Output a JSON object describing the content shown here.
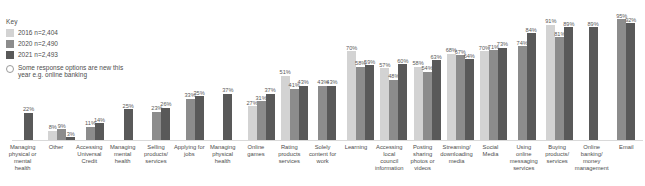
{
  "legend": {
    "title": "Key",
    "entries": [
      {
        "label": "2016  n=2,404",
        "color": "#d3d3d3"
      },
      {
        "label": "2020  n=2,490",
        "color": "#8c8c8c"
      },
      {
        "label": "2021  n=2,493",
        "color": "#595959"
      }
    ],
    "note": "Some response options are new this year e.g. online banking",
    "note_marker": "hollow-circle-icon"
  },
  "chart_data": {
    "type": "bar",
    "title": "",
    "xlabel": "",
    "ylabel": "",
    "ylim": [
      0,
      100
    ],
    "grid": false,
    "legend_position": "top-left",
    "series_names": [
      "2016",
      "2020",
      "2021"
    ],
    "series_colors": [
      "#d3d3d3",
      "#8c8c8c",
      "#595959"
    ],
    "categories": [
      "Managing physical or mental health",
      "Other",
      "Accessing Universal Credit",
      "Managing mental health",
      "Selling products/ services",
      "Applying for jobs",
      "Managing physical health",
      "Online games",
      "Rating products services",
      "Solely content for work",
      "Learning",
      "Accessing local council information",
      "Posting sharing photos or videos",
      "Streaming/ downloading media",
      "Social Media",
      "Using online messaging services",
      "Buying products/ services",
      "Online banking/ money management",
      "Email"
    ],
    "groups": [
      {
        "category": "Managing physical or mental health",
        "bars": [
          {
            "series": "2021",
            "value": 22,
            "label": "22%"
          }
        ]
      },
      {
        "category": "Other",
        "bars": [
          {
            "series": "2016",
            "value": 8,
            "label": "8%"
          },
          {
            "series": "2020",
            "value": 9,
            "label": "9%"
          },
          {
            "series": "2021",
            "value": 3,
            "label": "3%"
          }
        ]
      },
      {
        "category": "Accessing Universal Credit",
        "bars": [
          {
            "series": "2020",
            "value": 11,
            "label": "11%"
          },
          {
            "series": "2021",
            "value": 14,
            "label": "14%"
          }
        ]
      },
      {
        "category": "Managing mental health",
        "bars": [
          {
            "series": "2021",
            "value": 25,
            "label": "25%"
          }
        ]
      },
      {
        "category": "Selling products/ services",
        "bars": [
          {
            "series": "2020",
            "value": 23,
            "label": "23%"
          },
          {
            "series": "2021",
            "value": 26,
            "label": "26%"
          }
        ]
      },
      {
        "category": "Applying for jobs",
        "bars": [
          {
            "series": "2020",
            "value": 33,
            "label": "33%"
          },
          {
            "series": "2021",
            "value": 35,
            "label": "35%"
          }
        ]
      },
      {
        "category": "Managing physical health",
        "bars": [
          {
            "series": "2021",
            "value": 37,
            "label": "37%"
          }
        ]
      },
      {
        "category": "Online games",
        "bars": [
          {
            "series": "2016",
            "value": 27,
            "label": "27%"
          },
          {
            "series": "2020",
            "value": 31,
            "label": "31%"
          },
          {
            "series": "2021",
            "value": 37,
            "label": "37%"
          }
        ]
      },
      {
        "category": "Rating products services",
        "bars": [
          {
            "series": "2016",
            "value": 51,
            "label": "51%"
          },
          {
            "series": "2020",
            "value": 41,
            "label": "41%"
          },
          {
            "series": "2021",
            "value": 43,
            "label": "43%"
          }
        ]
      },
      {
        "category": "Solely content for work",
        "bars": [
          {
            "series": "2020",
            "value": 43,
            "label": "43%"
          },
          {
            "series": "2021",
            "value": 43,
            "label": "43%"
          }
        ]
      },
      {
        "category": "Learning",
        "bars": [
          {
            "series": "2016",
            "value": 70,
            "label": "70%"
          },
          {
            "series": "2020",
            "value": 58,
            "label": "58%"
          },
          {
            "series": "2021",
            "value": 59,
            "label": "59%"
          }
        ]
      },
      {
        "category": "Accessing local council information",
        "bars": [
          {
            "series": "2016",
            "value": 57,
            "label": "57%"
          },
          {
            "series": "2020",
            "value": 48,
            "label": "48%"
          },
          {
            "series": "2021",
            "value": 60,
            "label": "60%"
          }
        ]
      },
      {
        "category": "Posting sharing photos or videos",
        "bars": [
          {
            "series": "2016",
            "value": 58,
            "label": "58%"
          },
          {
            "series": "2020",
            "value": 54,
            "label": "54%"
          },
          {
            "series": "2021",
            "value": 63,
            "label": "63%"
          }
        ]
      },
      {
        "category": "Streaming/ downloading media",
        "bars": [
          {
            "series": "2016",
            "value": 68,
            "label": "68%"
          },
          {
            "series": "2020",
            "value": 67,
            "label": "67%"
          },
          {
            "series": "2021",
            "value": 64,
            "label": "64%"
          }
        ]
      },
      {
        "category": "Social Media",
        "bars": [
          {
            "series": "2016",
            "value": 70,
            "label": "70%"
          },
          {
            "series": "2020",
            "value": 71,
            "label": "71%"
          },
          {
            "series": "2021",
            "value": 73,
            "label": "73%"
          }
        ]
      },
      {
        "category": "Using online messaging services",
        "bars": [
          {
            "series": "2020",
            "value": 74,
            "label": "74%"
          },
          {
            "series": "2021",
            "value": 84,
            "label": "84%"
          }
        ]
      },
      {
        "category": "Buying products/ services",
        "bars": [
          {
            "series": "2016",
            "value": 91,
            "label": "91%"
          },
          {
            "series": "2020",
            "value": 81,
            "label": "81%"
          },
          {
            "series": "2021",
            "value": 89,
            "label": "89%"
          }
        ]
      },
      {
        "category": "Online banking/ money management",
        "bars": [
          {
            "series": "2021",
            "value": 89,
            "label": "89%"
          }
        ]
      },
      {
        "category": "Email",
        "bars": [
          {
            "series": "2020",
            "value": 95,
            "label": "95%"
          },
          {
            "series": "2021",
            "value": 92,
            "label": "92%"
          }
        ]
      }
    ]
  }
}
